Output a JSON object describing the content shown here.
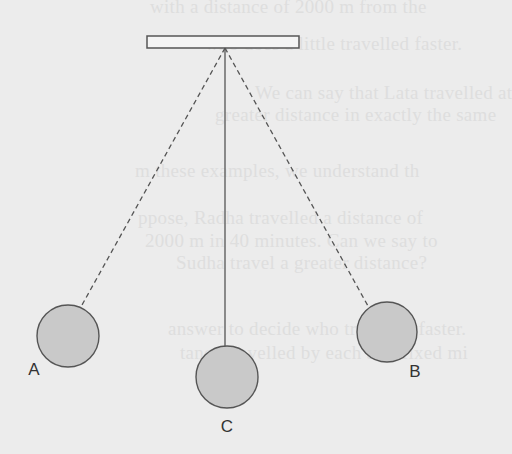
{
  "diagram": {
    "colors": {
      "background": "#ececec",
      "stroke": "#555555",
      "bob_fill": "#c9c9c9",
      "ghost_text": "#dedede"
    },
    "support": {
      "x": 147,
      "y": 36,
      "width": 152,
      "height": 12
    },
    "pivot": {
      "x": 225,
      "y": 48
    },
    "bobs": [
      {
        "id": "A",
        "label": "A",
        "cx": 68,
        "cy": 336,
        "r": 31,
        "string": "dashed",
        "label_x": 34,
        "label_y": 375
      },
      {
        "id": "C",
        "label": "C",
        "cx": 227,
        "cy": 377,
        "r": 31,
        "string": "solid",
        "label_x": 227,
        "label_y": 432
      },
      {
        "id": "B",
        "label": "B",
        "cx": 387,
        "cy": 332,
        "r": 30,
        "string": "dashed",
        "label_x": 415,
        "label_y": 377
      }
    ],
    "strings": [
      {
        "to": "A",
        "x2": 82,
        "y2": 305,
        "style": "dashed"
      },
      {
        "to": "C",
        "x2": 225,
        "y2": 346,
        "style": "solid"
      },
      {
        "to": "B",
        "x2": 368,
        "y2": 306,
        "style": "dashed"
      }
    ]
  },
  "ghost_text": {
    "lines": [
      {
        "text": "with a distance of 2000 m from the",
        "x": 150,
        "y": -4
      },
      {
        "text": "who does a little travelled faster.",
        "x": 205,
        "y": 33
      },
      {
        "text": "We can say that Lata travelled at",
        "x": 255,
        "y": 82
      },
      {
        "text": "greater distance in exactly the same",
        "x": 215,
        "y": 104
      },
      {
        "text": "m these examples, we understand th",
        "x": 135,
        "y": 160
      },
      {
        "text": "ppose, Radha travelled a distance of",
        "x": 138,
        "y": 207
      },
      {
        "text": "2000 m in 40 minutes. Can we say to",
        "x": 145,
        "y": 230
      },
      {
        "text": "Sudha travel a greater distance?",
        "x": 176,
        "y": 252
      },
      {
        "text": "answer to decide who travelled faster.",
        "x": 168,
        "y": 318
      },
      {
        "text": "tance travelled by each as a fixed mi",
        "x": 180,
        "y": 342
      }
    ]
  }
}
